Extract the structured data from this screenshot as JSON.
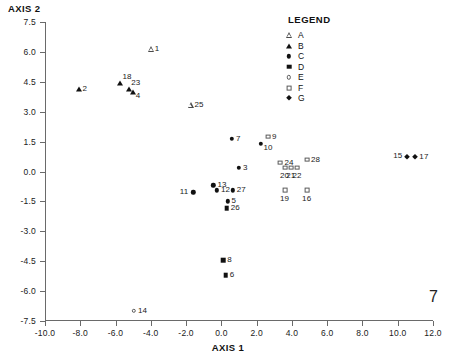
{
  "chart_data": {
    "type": "scatter",
    "title": "",
    "xlabel": "AXIS 1",
    "ylabel": "AXIS 2",
    "xlim": [
      -10.0,
      12.0
    ],
    "ylim": [
      -7.5,
      7.5
    ],
    "xticks": [
      "-10.0",
      "-8.0",
      "-6.0",
      "-4.0",
      "-2.0",
      "0.0",
      "2.0",
      "4.0",
      "6.0",
      "8.0",
      "10.0",
      "12.0"
    ],
    "xtick_values": [
      -10.0,
      -8.0,
      -6.0,
      -4.0,
      -2.0,
      0.0,
      2.0,
      4.0,
      6.0,
      8.0,
      10.0,
      12.0
    ],
    "yticks": [
      "7.5",
      "6.0",
      "4.5",
      "3.0",
      "1.5",
      "0.0",
      "-1.5",
      "-3.0",
      "-4.5",
      "-6.0",
      "-7.5"
    ],
    "ytick_values": [
      7.5,
      6.0,
      4.5,
      3.0,
      1.5,
      0.0,
      -1.5,
      -3.0,
      -4.5,
      -6.0,
      -7.5
    ],
    "grid": false,
    "legend_position": "top-right",
    "legend": {
      "title": "LEGEND",
      "entries": [
        {
          "label": "A",
          "marker": "triangle-open"
        },
        {
          "label": "B",
          "marker": "triangle-filled"
        },
        {
          "label": "C",
          "marker": "circle-filled"
        },
        {
          "label": "D",
          "marker": "square-filled"
        },
        {
          "label": "E",
          "marker": "circle-open"
        },
        {
          "label": "F",
          "marker": "square-open"
        },
        {
          "label": "G",
          "marker": "diamond-filled"
        }
      ]
    },
    "points": [
      {
        "label": "1",
        "x": -4.0,
        "y": 6.15,
        "group": "A",
        "marker": "triangle-open",
        "lpos": "right"
      },
      {
        "label": "2",
        "x": -8.1,
        "y": 4.15,
        "group": "B",
        "marker": "triangle-filled",
        "lpos": "right"
      },
      {
        "label": "18",
        "x": -5.75,
        "y": 4.45,
        "group": "B",
        "marker": "triangle-filled",
        "lpos": "above-right"
      },
      {
        "label": "23",
        "x": -5.25,
        "y": 4.15,
        "group": "B",
        "marker": "triangle-filled",
        "lpos": "above-right"
      },
      {
        "label": "4",
        "x": -5.0,
        "y": 4.0,
        "group": "B",
        "marker": "triangle-filled",
        "lpos": "below-right"
      },
      {
        "label": "25",
        "x": -1.75,
        "y": 3.35,
        "group": "A",
        "marker": "triangle-open",
        "lpos": "right"
      },
      {
        "label": "7",
        "x": 0.6,
        "y": 1.65,
        "group": "C",
        "marker": "circle-filled",
        "lpos": "right"
      },
      {
        "label": "9",
        "x": 2.65,
        "y": 1.75,
        "group": "F",
        "marker": "square-open",
        "lpos": "right"
      },
      {
        "label": "10",
        "x": 2.25,
        "y": 1.4,
        "group": "C",
        "marker": "circle-filled",
        "lpos": "below-right"
      },
      {
        "label": "28",
        "x": 4.85,
        "y": 0.6,
        "group": "F",
        "marker": "square-open",
        "lpos": "right"
      },
      {
        "label": "24",
        "x": 3.35,
        "y": 0.45,
        "group": "F",
        "marker": "square-open",
        "lpos": "right"
      },
      {
        "label": "20",
        "x": 3.6,
        "y": 0.2,
        "group": "F",
        "marker": "square-open",
        "lpos": "below"
      },
      {
        "label": "21",
        "x": 3.95,
        "y": 0.2,
        "group": "F",
        "marker": "square-open",
        "lpos": "below"
      },
      {
        "label": "22",
        "x": 4.3,
        "y": 0.2,
        "group": "F",
        "marker": "square-open",
        "lpos": "below"
      },
      {
        "label": "3",
        "x": 1.0,
        "y": 0.2,
        "group": "C",
        "marker": "circle-filled",
        "lpos": "right"
      },
      {
        "label": "13",
        "x": -0.45,
        "y": -0.7,
        "group": "C",
        "marker": "circle-filled",
        "lpos": "right"
      },
      {
        "label": "12",
        "x": -0.25,
        "y": -0.95,
        "group": "C",
        "marker": "circle-filled",
        "lpos": "right"
      },
      {
        "label": "11",
        "x": -1.6,
        "y": -1.05,
        "group": "C",
        "marker": "circle-filled",
        "lpos": "left"
      },
      {
        "label": "27",
        "x": 0.65,
        "y": -0.95,
        "group": "C",
        "marker": "circle-filled",
        "lpos": "right"
      },
      {
        "label": "19",
        "x": 3.6,
        "y": -0.95,
        "group": "F",
        "marker": "square-open",
        "lpos": "below"
      },
      {
        "label": "16",
        "x": 4.85,
        "y": -0.95,
        "group": "F",
        "marker": "square-open",
        "lpos": "below"
      },
      {
        "label": "5",
        "x": 0.35,
        "y": -1.5,
        "group": "C",
        "marker": "circle-filled",
        "lpos": "right"
      },
      {
        "label": "26",
        "x": 0.3,
        "y": -1.85,
        "group": "D",
        "marker": "square-filled",
        "lpos": "right"
      },
      {
        "label": "15",
        "x": 10.5,
        "y": 0.75,
        "group": "G",
        "marker": "diamond-filled",
        "lpos": "left"
      },
      {
        "label": "17",
        "x": 11.0,
        "y": 0.75,
        "group": "G",
        "marker": "diamond-filled",
        "lpos": "right"
      },
      {
        "label": "8",
        "x": 0.1,
        "y": -4.45,
        "group": "D",
        "marker": "square-filled",
        "lpos": "right"
      },
      {
        "label": "6",
        "x": 0.25,
        "y": -5.2,
        "group": "D",
        "marker": "square-filled",
        "lpos": "right"
      },
      {
        "label": "14",
        "x": -4.95,
        "y": -7.0,
        "group": "E",
        "marker": "circle-open",
        "lpos": "right"
      }
    ]
  },
  "page": {
    "number": "7"
  }
}
